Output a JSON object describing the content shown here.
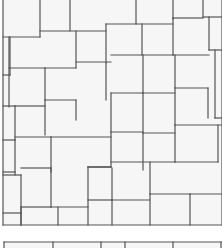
{
  "diagram": {
    "type": "tile-paving-pattern",
    "background": "#ffffff",
    "tile_fill": "#f6f6f6",
    "line_color": "#555555",
    "main_area": {
      "x": 3,
      "y": 0,
      "width": 219,
      "height": 225
    },
    "bottom_strip": {
      "x": 4,
      "y": 242,
      "width": 218,
      "height": 6
    },
    "segments": [
      [
        3,
        0,
        3,
        225
      ],
      [
        3,
        225,
        222,
        225
      ],
      [
        40,
        0,
        40,
        37
      ],
      [
        70,
        0,
        70,
        31
      ],
      [
        136,
        0,
        136,
        24
      ],
      [
        173,
        0,
        173,
        19
      ],
      [
        203,
        0,
        203,
        17
      ],
      [
        203,
        17,
        222,
        17
      ],
      [
        173,
        18,
        203,
        18
      ],
      [
        106,
        24,
        173,
        24
      ],
      [
        40,
        31,
        106,
        31
      ],
      [
        3,
        37,
        40,
        37
      ],
      [
        10,
        37,
        10,
        75
      ],
      [
        3,
        75,
        10,
        75
      ],
      [
        9,
        68,
        45,
        68
      ],
      [
        9,
        37,
        9,
        107
      ],
      [
        76,
        31,
        76,
        68
      ],
      [
        106,
        24,
        106,
        63
      ],
      [
        142,
        24,
        142,
        55
      ],
      [
        173,
        18,
        173,
        55
      ],
      [
        209,
        17,
        209,
        50
      ],
      [
        76,
        62,
        111,
        62
      ],
      [
        111,
        55,
        173,
        55
      ],
      [
        173,
        55,
        209,
        55
      ],
      [
        209,
        50,
        222,
        50
      ],
      [
        215,
        50,
        215,
        118
      ],
      [
        215,
        118,
        222,
        118
      ],
      [
        45,
        68,
        45,
        100
      ],
      [
        45,
        68,
        76,
        68
      ],
      [
        106,
        63,
        106,
        100
      ],
      [
        143,
        55,
        143,
        93
      ],
      [
        175,
        55,
        175,
        88
      ],
      [
        208,
        88,
        208,
        118
      ],
      [
        3,
        106,
        15,
        106
      ],
      [
        15,
        106,
        15,
        140
      ],
      [
        15,
        106,
        45,
        106
      ],
      [
        45,
        100,
        76,
        100
      ],
      [
        76,
        100,
        76,
        120
      ],
      [
        111,
        93,
        111,
        132
      ],
      [
        111,
        93,
        143,
        93
      ],
      [
        143,
        93,
        175,
        93
      ],
      [
        175,
        88,
        208,
        88
      ],
      [
        143,
        93,
        143,
        133
      ],
      [
        175,
        88,
        175,
        125
      ],
      [
        45,
        100,
        45,
        135
      ],
      [
        3,
        140,
        15,
        140
      ],
      [
        15,
        137,
        51,
        137
      ],
      [
        51,
        137,
        51,
        172
      ],
      [
        3,
        172,
        15,
        172
      ],
      [
        15,
        140,
        15,
        175
      ],
      [
        51,
        137,
        111,
        137
      ],
      [
        111,
        132,
        111,
        167
      ],
      [
        111,
        132,
        143,
        132
      ],
      [
        143,
        133,
        175,
        133
      ],
      [
        175,
        125,
        222,
        125
      ],
      [
        143,
        133,
        143,
        170
      ],
      [
        175,
        125,
        175,
        162
      ],
      [
        218,
        125,
        218,
        162
      ],
      [
        88,
        167,
        111,
        167
      ],
      [
        21,
        175,
        21,
        225
      ],
      [
        3,
        175,
        21,
        175
      ],
      [
        21,
        168,
        51,
        168
      ],
      [
        51,
        168,
        51,
        207
      ],
      [
        51,
        207,
        88,
        207
      ],
      [
        88,
        167,
        88,
        225
      ],
      [
        88,
        167,
        111,
        167
      ],
      [
        111,
        162,
        175,
        162
      ],
      [
        175,
        162,
        218,
        162
      ],
      [
        112,
        168,
        112,
        200
      ],
      [
        150,
        162,
        150,
        194
      ],
      [
        3,
        213,
        21,
        213
      ],
      [
        21,
        207,
        21,
        225
      ],
      [
        21,
        207,
        51,
        207
      ],
      [
        58,
        207,
        58,
        225
      ],
      [
        88,
        200,
        112,
        200
      ],
      [
        112,
        200,
        112,
        225
      ],
      [
        112,
        200,
        150,
        200
      ],
      [
        150,
        194,
        190,
        194
      ],
      [
        190,
        194,
        190,
        225
      ],
      [
        150,
        194,
        150,
        225
      ],
      [
        190,
        194,
        222,
        194
      ],
      [
        222,
        0,
        222,
        225
      ],
      [
        4,
        242,
        222,
        242
      ],
      [
        4,
        242,
        4,
        248
      ],
      [
        53,
        242,
        53,
        248
      ],
      [
        101,
        242,
        101,
        248
      ],
      [
        125,
        242,
        125,
        248
      ],
      [
        173,
        242,
        173,
        248
      ],
      [
        221,
        242,
        221,
        248
      ]
    ]
  }
}
